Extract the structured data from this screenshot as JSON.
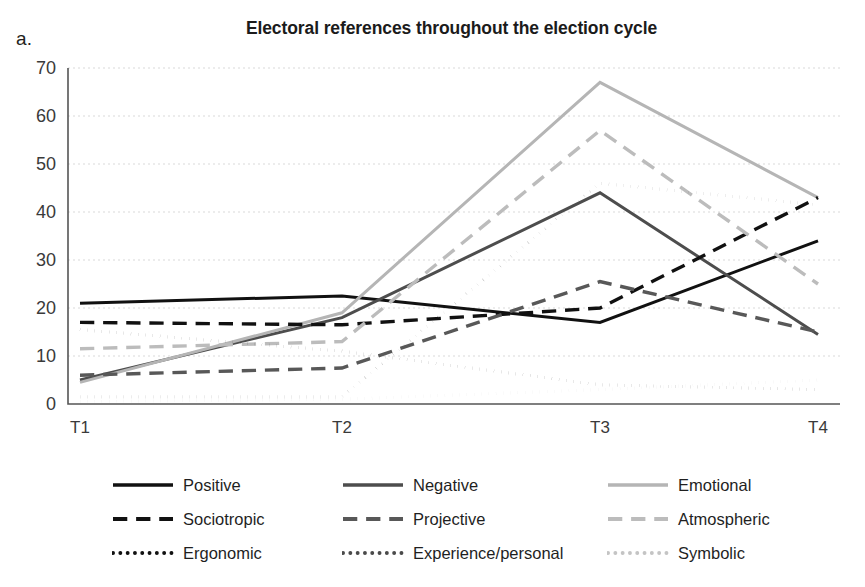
{
  "panel_label": "a.",
  "chart_data": {
    "type": "line",
    "title": "Electoral references throughout the election cycle",
    "xlabel": "",
    "ylabel": "",
    "categories": [
      "T1",
      "T2",
      "T3",
      "T4"
    ],
    "x_tick_labels": [
      "T1",
      "T2",
      "T3",
      "T4"
    ],
    "y_tick_labels": [
      "0",
      "10",
      "20",
      "30",
      "40",
      "50",
      "60",
      "70"
    ],
    "y_ticks": [
      0,
      10,
      20,
      30,
      40,
      50,
      60,
      70
    ],
    "ylim": [
      0,
      70
    ],
    "grid": "horizontal-dotted",
    "legend_position": "bottom",
    "series": [
      {
        "name": "Positive",
        "values": [
          21,
          22.5,
          17,
          34
        ],
        "color": "#111111",
        "dash": "solid",
        "width": 3.0
      },
      {
        "name": "Negative",
        "values": [
          5,
          18,
          44,
          14.5
        ],
        "color": "#4d4d4d",
        "dash": "solid",
        "width": 3.0
      },
      {
        "name": "Emotional",
        "values": [
          4.5,
          19,
          67,
          43
        ],
        "color": "#b5b5b5",
        "dash": "solid",
        "width": 3.0
      },
      {
        "name": "Sociotropic",
        "values": [
          17,
          16.5,
          20,
          43
        ],
        "color": "#111111",
        "dash": "dashed",
        "width": 3.4
      },
      {
        "name": "Projective",
        "values": [
          6,
          7.5,
          25.5,
          15
        ],
        "color": "#585858",
        "dash": "dashed",
        "width": 3.4
      },
      {
        "name": "Atmospheric",
        "values": [
          11.5,
          13,
          57,
          25
        ],
        "color": "#bcbcbc",
        "dash": "dashed",
        "width": 3.4
      },
      {
        "name": "Ergonomic",
        "values": [
          15.5,
          11,
          4,
          3
        ],
        "color": "#111111",
        "dash": "dotted",
        "width": 3.2
      },
      {
        "name": "Experience/personal",
        "values": [
          1.5,
          1.5,
          46,
          41.5
        ],
        "color": "#4a4a4a",
        "dash": "dotted",
        "width": 3.2
      },
      {
        "name": "Symbolic",
        "values": [
          0.5,
          1,
          3,
          5
        ],
        "color": "#c4c4c4",
        "dash": "dotted",
        "width": 3.2
      }
    ]
  },
  "legend": {
    "items": [
      {
        "label": "Positive"
      },
      {
        "label": "Negative"
      },
      {
        "label": "Emotional"
      },
      {
        "label": "Sociotropic"
      },
      {
        "label": "Projective"
      },
      {
        "label": "Atmospheric"
      },
      {
        "label": "Ergonomic"
      },
      {
        "label": "Experience/personal"
      },
      {
        "label": "Symbolic"
      }
    ],
    "order": [
      0,
      1,
      2,
      3,
      4,
      5,
      6,
      7,
      8
    ]
  }
}
